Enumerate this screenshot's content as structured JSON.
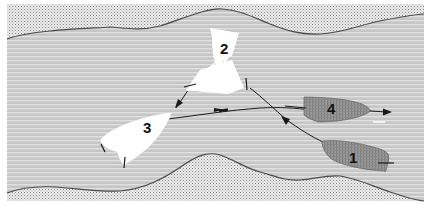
{
  "diagram": {
    "type": "boat-maneuver-illustration",
    "colors": {
      "background": "#ffffff",
      "water": "#c4c4c4",
      "water_stripe": "#e2e2e2",
      "bank": "#e6e6e6",
      "bank_dot": "#9a9a9a",
      "shore_line": "#555555",
      "white_boat": "#ffffff",
      "dark_boat": "#8e8e8e",
      "arrow": "#222222"
    },
    "boats": [
      {
        "id": "1",
        "label": "1",
        "style": "dark"
      },
      {
        "id": "2",
        "label": "2",
        "style": "white"
      },
      {
        "id": "3",
        "label": "3",
        "style": "white"
      },
      {
        "id": "4",
        "label": "4",
        "style": "dark"
      }
    ],
    "paths": [
      {
        "from": "1",
        "to": "2",
        "label": "path-1-to-2"
      },
      {
        "from": "2",
        "to": "3",
        "label": "path-2-to-3"
      },
      {
        "from": "3",
        "to": "4",
        "label": "path-3-to-4"
      },
      {
        "from": "4",
        "to": "downstream",
        "label": "path-4-onward"
      }
    ]
  }
}
